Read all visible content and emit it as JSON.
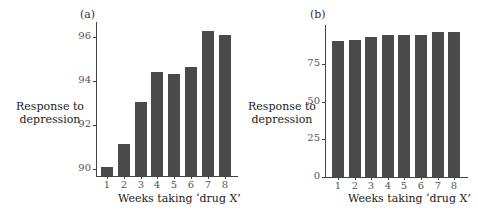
{
  "chart_data": [
    {
      "type": "bar",
      "panel": "(a)",
      "title": "",
      "xlabel": "Weeks taking ‘drug X’",
      "ylabel": "Response to depression",
      "ylabel_lines": [
        "Response to",
        "depression"
      ],
      "categories": [
        "1",
        "2",
        "3",
        "4",
        "5",
        "6",
        "7",
        "8"
      ],
      "values": [
        90.1,
        91.15,
        93.05,
        94.4,
        94.3,
        94.65,
        96.25,
        96.1
      ],
      "yticks": [
        90,
        92,
        94,
        96
      ],
      "ylim": [
        89.7,
        96.4
      ],
      "grid": false,
      "bar_color": "#4a4a4a"
    },
    {
      "type": "bar",
      "panel": "(b)",
      "title": "",
      "xlabel": "Weeks taking ‘drug X’",
      "ylabel": "Response to depression",
      "ylabel_lines": [
        "Response to",
        "depression"
      ],
      "categories": [
        "1",
        "2",
        "3",
        "4",
        "5",
        "6",
        "7",
        "8"
      ],
      "values": [
        90.1,
        91.15,
        93.05,
        94.4,
        94.3,
        94.65,
        96.25,
        96.1
      ],
      "yticks": [
        0,
        25,
        50,
        75
      ],
      "ylim": [
        0,
        97
      ],
      "grid": false,
      "bar_color": "#4a4a4a"
    }
  ]
}
